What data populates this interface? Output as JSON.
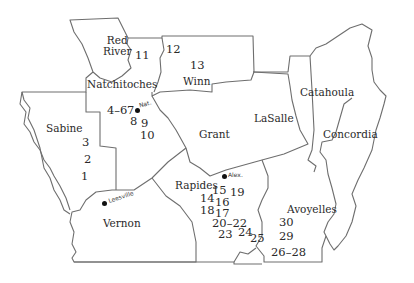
{
  "map": {
    "title": "",
    "parishes": [
      {
        "name": "Red River",
        "line1": "Red",
        "line2": "River"
      },
      {
        "name": "Natchitoches"
      },
      {
        "name": "Winn"
      },
      {
        "name": "Sabine"
      },
      {
        "name": "Grant"
      },
      {
        "name": "LaSalle"
      },
      {
        "name": "Catahoula"
      },
      {
        "name": "Concordia"
      },
      {
        "name": "Rapides"
      },
      {
        "name": "Vernon"
      },
      {
        "name": "Avoyelles"
      }
    ],
    "towns": [
      {
        "name": "Natchitoches (handwritten)",
        "label": "Nat."
      },
      {
        "name": "Alexandria (handwritten)",
        "label": "Alex."
      },
      {
        "name": "Leesville (handwritten)",
        "label": "Leesville"
      }
    ],
    "site_numbers": {
      "red_river": "11",
      "winn_a": "12",
      "winn_b": "13",
      "natch_a": "4–6",
      "natch_b": "7",
      "natch_c": "8",
      "natch_d": "9",
      "natch_e": "10",
      "sabine_a": "3",
      "sabine_b": "2",
      "sabine_c": "1",
      "rap_15": "15",
      "rap_19": "19",
      "rap_14": "14",
      "rap_16": "16",
      "rap_18": "18",
      "rap_17": "17",
      "rap_20_22": "20–22",
      "rap_23": "23",
      "rap_24": "24",
      "rap_25": "25",
      "avo_30": "30",
      "avo_29": "29",
      "avo_26_28": "26–28"
    }
  }
}
